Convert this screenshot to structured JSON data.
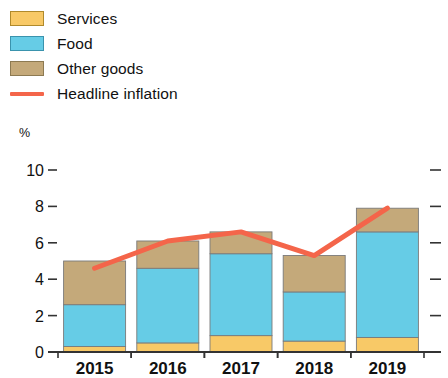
{
  "legend": {
    "items": [
      {
        "label": "Services",
        "swatch": "services",
        "kind": "box",
        "color": "#F8C967"
      },
      {
        "label": "Food",
        "swatch": "food",
        "kind": "box",
        "color": "#66CCE6"
      },
      {
        "label": "Other goods",
        "swatch": "other",
        "kind": "box",
        "color": "#C4A97A"
      },
      {
        "label": "Headline inflation",
        "swatch": "headline",
        "kind": "line",
        "color": "#F4654A"
      }
    ]
  },
  "axis": {
    "unit_label": "%",
    "y_ticks": [
      "0",
      "2",
      "4",
      "6",
      "8",
      "10"
    ],
    "x_ticks": [
      "2015",
      "2016",
      "2017",
      "2018",
      "2019"
    ]
  },
  "chart_data": {
    "type": "bar",
    "title": "",
    "subtitle": "",
    "xlabel": "",
    "ylabel": "%",
    "ylim": [
      0,
      10
    ],
    "yticks": [
      0,
      2,
      4,
      6,
      8,
      10
    ],
    "grid": false,
    "legend_position": "top-left",
    "stacked": true,
    "categories": [
      "2015",
      "2016",
      "2017",
      "2018",
      "2019"
    ],
    "series": [
      {
        "name": "Services",
        "type": "bar",
        "color": "#F8C967",
        "values": [
          0.3,
          0.5,
          0.9,
          0.6,
          0.8
        ]
      },
      {
        "name": "Food",
        "type": "bar",
        "color": "#66CCE6",
        "values": [
          2.3,
          4.1,
          4.5,
          2.7,
          5.8
        ]
      },
      {
        "name": "Other goods",
        "type": "bar",
        "color": "#C4A97A",
        "values": [
          2.4,
          1.5,
          1.2,
          2.0,
          1.3
        ]
      },
      {
        "name": "Headline inflation",
        "type": "line",
        "color": "#F4654A",
        "values": [
          4.6,
          6.1,
          6.6,
          5.3,
          7.9
        ]
      }
    ],
    "stack_totals": [
      5.0,
      6.1,
      6.6,
      5.3,
      7.9
    ]
  }
}
